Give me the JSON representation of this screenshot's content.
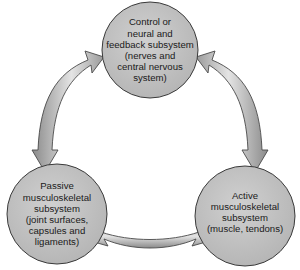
{
  "diagram": {
    "type": "cycle",
    "colors": {
      "node_fill": "#c4c4c4",
      "node_stroke": "#3a3a3a",
      "arrow_light": "#e6e6e6",
      "arrow_dark": "#8a8a8a",
      "arrow_stroke": "#4a4a4a",
      "background": "#ffffff"
    },
    "nodes": [
      {
        "id": "control",
        "lines": [
          "Control or",
          "neural and",
          "feedback subsystem",
          "(nerves and",
          "central nervous",
          "system)"
        ]
      },
      {
        "id": "passive",
        "lines": [
          "Passive",
          "musculoskeletal",
          "subsystem",
          "(joint surfaces,",
          "capsules and",
          "ligaments)"
        ]
      },
      {
        "id": "active",
        "lines": [
          "Active",
          "musculoskeletal",
          "subsystem",
          "(muscle, tendons)"
        ]
      }
    ],
    "edges": [
      {
        "from": "control",
        "to": "passive",
        "direction": "bidirectional"
      },
      {
        "from": "control",
        "to": "active",
        "direction": "bidirectional"
      },
      {
        "from": "passive",
        "to": "active",
        "direction": "bidirectional"
      }
    ]
  }
}
